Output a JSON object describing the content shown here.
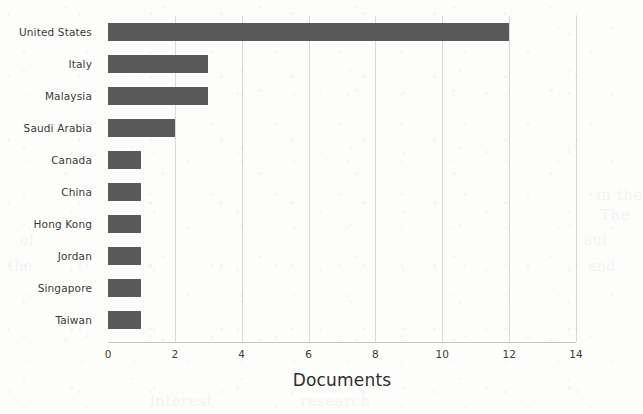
{
  "chart_data": {
    "type": "bar",
    "orientation": "horizontal",
    "title": "",
    "xlabel": "Documents",
    "ylabel": "",
    "categories": [
      "United States",
      "Italy",
      "Malaysia",
      "Saudi Arabia",
      "Canada",
      "China",
      "Hong Kong",
      "Jordan",
      "Singapore",
      "Taiwan"
    ],
    "values": [
      12,
      3,
      3,
      2,
      1,
      1,
      1,
      1,
      1,
      1
    ],
    "xticks": [
      0,
      2,
      4,
      6,
      8,
      10,
      12,
      14
    ],
    "xtick_labels": [
      "0",
      "2",
      "4",
      "6",
      "8",
      "10",
      "12",
      "14"
    ],
    "xlim": [
      0,
      14
    ],
    "grid": "vertical-only",
    "legend": "none",
    "bar_color": "#59595a",
    "gridline_color": "#d9d9d6",
    "background_color": "#fdfdfc",
    "text_color": "#3b3b3b"
  },
  "showthrough_text": [
    {
      "text": "in the",
      "x": 596,
      "y": 186,
      "size": 15
    },
    {
      "text": "The",
      "x": 600,
      "y": 206,
      "size": 15
    },
    {
      "text": "of",
      "x": 20,
      "y": 232,
      "size": 14
    },
    {
      "text": "aut",
      "x": 584,
      "y": 232,
      "size": 14
    },
    {
      "text": "the",
      "x": 8,
      "y": 258,
      "size": 14
    },
    {
      "text": "and",
      "x": 588,
      "y": 258,
      "size": 14
    },
    {
      "text": "interest",
      "x": 150,
      "y": 392,
      "size": 15
    },
    {
      "text": "research",
      "x": 300,
      "y": 392,
      "size": 15
    }
  ]
}
